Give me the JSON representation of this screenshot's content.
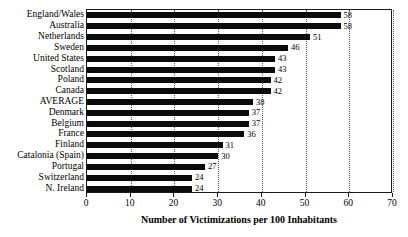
{
  "chart_data": {
    "type": "bar",
    "orientation": "horizontal",
    "title": "",
    "xlabel": "Number of Victimizations per 100 Inhabitants",
    "ylabel": "",
    "xlim": [
      0,
      70
    ],
    "xticks": [
      0,
      10,
      20,
      30,
      40,
      50,
      60,
      70
    ],
    "xtick_labels": [
      "0",
      "10",
      "20",
      "30",
      "40",
      "50",
      "60",
      "70"
    ],
    "grid": "vertical-dotted",
    "legend": "none",
    "bar_color": "#0b0b0b",
    "categories": [
      "England/Wales",
      "Australia",
      "Netherlands",
      "Sweden",
      "United States",
      "Scotland",
      "Poland",
      "Canada",
      "AVERAGE",
      "Denmark",
      "Belgium",
      "France",
      "Finland",
      "Catalonia (Spain)",
      "Portugal",
      "Switzerland",
      "N. Ireland"
    ],
    "values": [
      58,
      58,
      51,
      46,
      43,
      43,
      42,
      42,
      38,
      37,
      37,
      36,
      31,
      30,
      27,
      24,
      24
    ],
    "data_labels": [
      "58",
      "58",
      "51",
      "46",
      "43",
      "43",
      "42",
      "42",
      "38",
      "37",
      "37",
      "36",
      "31",
      "30",
      "27",
      "24",
      "24"
    ]
  }
}
